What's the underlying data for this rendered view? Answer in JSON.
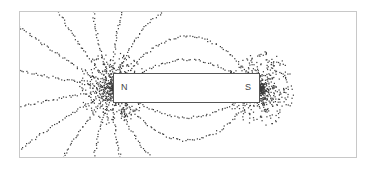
{
  "diagram": {
    "title": "",
    "magnet": {
      "north_label": "N",
      "south_label": "S"
    },
    "colors": {
      "filings": "#3a3a3a",
      "frame": "#c8c8c8",
      "magnet_border": "#555555",
      "background": "#ffffff"
    }
  }
}
